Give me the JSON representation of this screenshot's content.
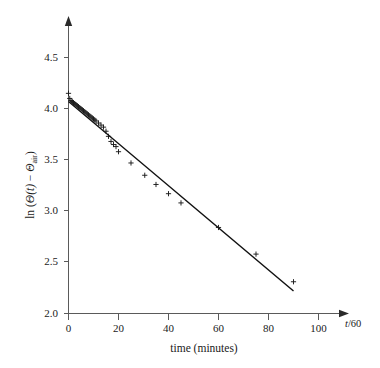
{
  "figure": {
    "title": "",
    "background_color": "#ffffff",
    "line_color": "#111111",
    "marker_color": "#1a1a1a",
    "axis_color": "#5a5a5a"
  },
  "axes": {
    "x_end_label": "t/60",
    "x_end_label_italic_part": "t",
    "x_end_label_rest": "/60",
    "x_title": "time (minutes)",
    "y_title_prefix": "ln (",
    "y_title_theta": "Θ",
    "y_title_of_t": "(t)",
    "y_title_minus": " − ",
    "y_title_theta2": "Θ",
    "y_title_sub": "air",
    "y_title_suffix": ")",
    "y_title_plain": "ln (Θ(t) − Θair)"
  },
  "chart_data": {
    "type": "scatter",
    "title": "",
    "xlabel": "time (minutes)",
    "ylabel": "ln (Θ(t) − Θair)",
    "xlim": [
      0,
      108
    ],
    "ylim": [
      2.0,
      4.7
    ],
    "grid": false,
    "legend": null,
    "xticks": [
      0,
      20,
      40,
      60,
      80,
      100
    ],
    "xtick_labels": [
      "0",
      "20",
      "40",
      "60",
      "80",
      "100"
    ],
    "yticks": [
      2.0,
      2.5,
      3.0,
      3.5,
      4.0,
      4.5
    ],
    "ytick_labels": [
      "2.0",
      "2.5",
      "3.0",
      "3.5",
      "4.0",
      "4.5"
    ],
    "marker": "+",
    "series": [
      {
        "name": "measurements",
        "marker": "+",
        "x": [
          0.0,
          0.5,
          1.0,
          1.5,
          2.0,
          2.5,
          3.0,
          3.5,
          4.0,
          4.5,
          5.0,
          5.5,
          6.0,
          6.5,
          7.0,
          7.5,
          8.0,
          8.5,
          9.0,
          9.5,
          10.0,
          10.5,
          11.0,
          12.0,
          13.0,
          14.0,
          15.0,
          16.0,
          17.0,
          18.0,
          19.0,
          20.0,
          25.0,
          30.5,
          35.0,
          40.0,
          45.0,
          60.0,
          75.0,
          90.0
        ],
        "y": [
          4.15,
          4.1,
          4.08,
          4.07,
          4.06,
          4.05,
          4.04,
          4.03,
          4.02,
          4.01,
          4.0,
          3.99,
          3.98,
          3.97,
          3.96,
          3.95,
          3.94,
          3.93,
          3.92,
          3.91,
          3.9,
          3.89,
          3.88,
          3.86,
          3.84,
          3.82,
          3.78,
          3.73,
          3.68,
          3.65,
          3.63,
          3.58,
          3.47,
          3.35,
          3.26,
          3.17,
          3.08,
          2.84,
          2.58,
          2.31
        ]
      }
    ],
    "fit_line": {
      "name": "least-squares fit",
      "x": [
        0,
        90
      ],
      "y": [
        4.07,
        2.22
      ],
      "slope": -0.02056,
      "intercept": 4.07
    }
  }
}
